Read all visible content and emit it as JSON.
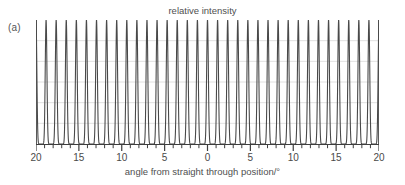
{
  "figure": {
    "panel_label": "(a)",
    "background_color": "#ffffff"
  },
  "chart_data": {
    "type": "line",
    "title": "relative intensity",
    "subtitle": "",
    "xlabel": "angle from straight through position/°",
    "ylabel": "relative intensity",
    "xlim": [
      -20,
      20
    ],
    "ylim": [
      0,
      1
    ],
    "x_tick_labels": [
      "20",
      "15",
      "10",
      "5",
      "0",
      "5",
      "10",
      "15",
      "20"
    ],
    "x_tick_values": [
      -20,
      -15,
      -10,
      -5,
      0,
      5,
      10,
      15,
      20
    ],
    "x_minor_tick_interval": 1,
    "y_tick_labels": [],
    "grid": {
      "horizontal": true,
      "vertical": false,
      "horizontal_count": 5,
      "color": "#d8d8d8"
    },
    "legend": {
      "show": false,
      "position": "none"
    },
    "annotations": [
      "(a)"
    ],
    "series": [
      {
        "name": "relative intensity",
        "color": "#4a4a4a",
        "line_width": 1.1,
        "description": "diffraction grating interference pattern: sharp equally-spaced maxima",
        "peak_count": 34,
        "peak_period_degrees": 1.1765,
        "peak_sharpness": 14,
        "peak_height": 1.0,
        "baseline": 0.0
      }
    ]
  }
}
